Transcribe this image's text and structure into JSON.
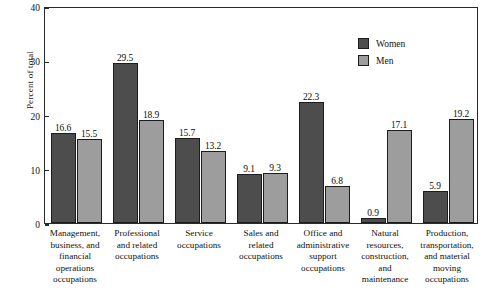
{
  "chart_data": {
    "type": "bar",
    "title": "",
    "subtitle": "",
    "xlabel": "",
    "ylabel": "Percent of total",
    "ylim": [
      0,
      40
    ],
    "yticks": [
      0,
      10,
      20,
      30,
      40
    ],
    "grid": false,
    "legend_position": "top-right",
    "categories": [
      "Management, business, and financial operations occupations",
      "Professional and related occupations",
      "Service occupations",
      "Sales and related occupations",
      "Office and administrative support occupations",
      "Natural resources, construction, and maintenance",
      "Production, transportation, and material moving occupations"
    ],
    "category_lines": [
      [
        "Management,",
        "business, and",
        "financial",
        "operations",
        "occupations"
      ],
      [
        "Professional",
        "and related",
        "occupations"
      ],
      [
        "Service",
        "occupations"
      ],
      [
        "Sales and",
        "related",
        "occupations"
      ],
      [
        "Office and",
        "administrative",
        "support",
        "occupations"
      ],
      [
        "Natural",
        "resources,",
        "construction,",
        "and",
        "maintenance"
      ],
      [
        "Production,",
        "transportation,",
        "and material",
        "moving",
        "occupations"
      ]
    ],
    "series": [
      {
        "name": "Women",
        "color": "#4d4d4d",
        "values": [
          16.6,
          29.5,
          15.7,
          9.1,
          22.3,
          0.9,
          5.9
        ]
      },
      {
        "name": "Men",
        "color": "#9d9d9d",
        "values": [
          15.5,
          18.9,
          13.2,
          9.3,
          6.8,
          17.1,
          19.2
        ]
      }
    ]
  },
  "legend": {
    "items": [
      {
        "label": "Women",
        "key": "women"
      },
      {
        "label": "Men",
        "key": "men"
      }
    ]
  },
  "axis": {
    "y_title": "Percent of total",
    "y_tick_labels": [
      "40",
      "30",
      "20",
      "10",
      "0"
    ]
  }
}
